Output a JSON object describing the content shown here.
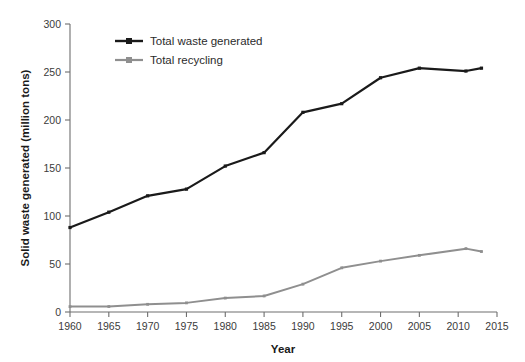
{
  "chart_data": {
    "type": "line",
    "title": "",
    "xlabel": "Year",
    "ylabel": "Solid waste generated (million tons)",
    "x": [
      1960,
      1965,
      1970,
      1975,
      1980,
      1985,
      1990,
      1995,
      2000,
      2005,
      2011,
      2013
    ],
    "xlim": [
      1960,
      2015
    ],
    "ylim": [
      0,
      300
    ],
    "xticks": [
      "1960",
      "1965",
      "1970",
      "1975",
      "1980",
      "1985",
      "1990",
      "1995",
      "2000",
      "2005",
      "2010",
      "2015"
    ],
    "xtick_values": [
      1960,
      1965,
      1970,
      1975,
      1980,
      1985,
      1990,
      1995,
      2000,
      2005,
      2010,
      2015
    ],
    "yticks": [
      "0",
      "50",
      "100",
      "150",
      "200",
      "250",
      "300"
    ],
    "ytick_values": [
      0,
      50,
      100,
      150,
      200,
      250,
      300
    ],
    "grid": false,
    "legend_position": "top-left",
    "series": [
      {
        "name": "Total waste generated",
        "color": "#1a1a1a",
        "values": [
          88,
          104,
          121,
          128,
          152,
          166,
          208,
          217,
          244,
          254,
          251,
          254
        ]
      },
      {
        "name": "Total recycling",
        "color": "#8f8f8f",
        "values": [
          5.6,
          5.7,
          8.0,
          9.5,
          14.5,
          16.7,
          29.0,
          46.0,
          53.0,
          59.0,
          66.0,
          63.0
        ]
      }
    ]
  },
  "legend": {
    "items": [
      {
        "label": "Total waste generated",
        "color": "#1a1a1a"
      },
      {
        "label": "Total recycling",
        "color": "#8f8f8f"
      }
    ]
  },
  "axes": {
    "x_title": "Year",
    "y_title": "Solid waste generated (million tons)"
  }
}
